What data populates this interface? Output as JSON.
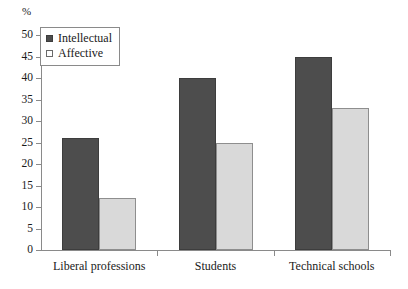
{
  "chart_data": {
    "type": "bar",
    "title": "",
    "subtitle": "",
    "xlabel": "",
    "ylabel": "%",
    "unit_label": "%",
    "categories": [
      "Liberal professions",
      "Students",
      "Technical schools"
    ],
    "series": [
      {
        "name": "Intellectual",
        "values": [
          26,
          40,
          45
        ],
        "color": "#4d4d4d"
      },
      {
        "name": "Affective",
        "values": [
          12,
          25,
          33
        ],
        "color": "#d9d9d9"
      }
    ],
    "ylim": [
      0,
      50
    ],
    "ytick_step": 5,
    "yticks": [
      0,
      5,
      10,
      15,
      20,
      25,
      30,
      35,
      40,
      45,
      50
    ],
    "ytick_labels": [
      "0",
      "5",
      "10",
      "15",
      "20",
      "25",
      "30",
      "35",
      "40",
      "45",
      "50"
    ],
    "grid": false,
    "legend_position": "top-left",
    "legend_entries": [
      {
        "label": "Intellectual",
        "marker": "filled-square-dark"
      },
      {
        "label": "Affective",
        "marker": "open-square-light"
      }
    ]
  }
}
